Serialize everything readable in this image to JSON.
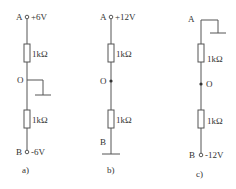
{
  "circuits": [
    {
      "id": "a",
      "caption": "a)",
      "node_top": {
        "label": "A",
        "voltage": "+6V",
        "terminal": "open"
      },
      "node_mid": {
        "label": "O",
        "grounded": true
      },
      "node_bottom": {
        "label": "B",
        "voltage": "-6V",
        "terminal": "open"
      },
      "resistors": [
        {
          "value": "1kΩ"
        },
        {
          "value": "1kΩ"
        }
      ]
    },
    {
      "id": "b",
      "caption": "b)",
      "node_top": {
        "label": "A",
        "voltage": "+12V",
        "terminal": "open"
      },
      "node_mid": {
        "label": "O",
        "grounded": false
      },
      "node_bottom": {
        "label": "B",
        "voltage": "",
        "grounded": true
      },
      "resistors": [
        {
          "value": "1kΩ"
        },
        {
          "value": "1kΩ"
        }
      ]
    },
    {
      "id": "c",
      "caption": "c)",
      "node_top": {
        "label": "A",
        "voltage": "",
        "grounded": true
      },
      "node_mid": {
        "label": "O",
        "grounded": false
      },
      "node_bottom": {
        "label": "B",
        "voltage": "-12V",
        "terminal": "open"
      },
      "resistors": [
        {
          "value": "1kΩ"
        },
        {
          "value": "1kΩ"
        }
      ]
    }
  ]
}
